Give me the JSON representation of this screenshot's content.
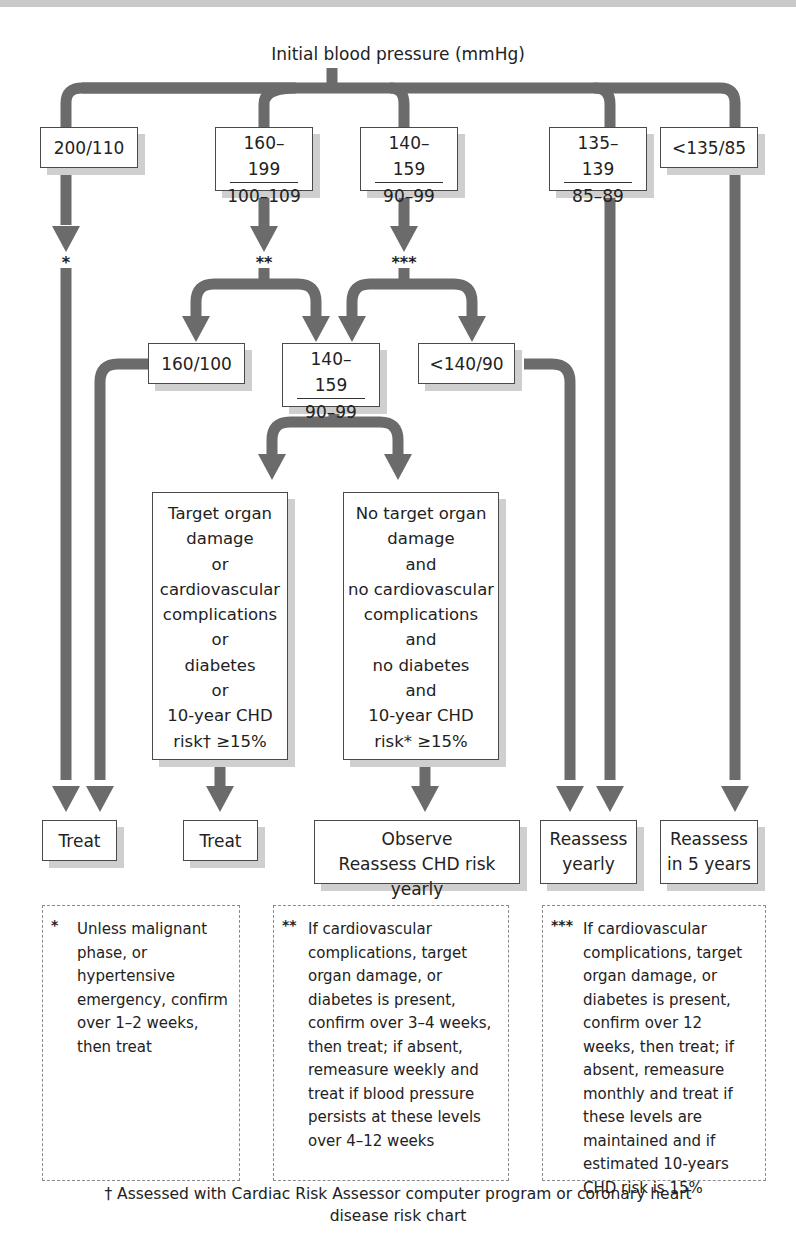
{
  "title": "Initial blood pressure (mmHg)",
  "level1": [
    {
      "id": "bp-200-110",
      "label": "200/110"
    },
    {
      "id": "bp-160-199",
      "top": "160–199",
      "bottom": "100–109"
    },
    {
      "id": "bp-140-159",
      "top": "140–159",
      "bottom": "90–99"
    },
    {
      "id": "bp-135-139",
      "top": "135–139",
      "bottom": "85–89"
    },
    {
      "id": "bp-lt-135-85",
      "label": "<135/85"
    }
  ],
  "markers": {
    "single": "*",
    "double": "**",
    "triple": "***"
  },
  "level2": [
    {
      "id": "bp-160-100",
      "label": "160/100"
    },
    {
      "id": "bp-140-159-followup",
      "top": "140–159",
      "bottom": "90–99"
    },
    {
      "id": "bp-lt-140-90",
      "label": "<140/90"
    }
  ],
  "conditions": {
    "risk_present": [
      "Target organ",
      "damage",
      "or",
      "cardiovascular",
      "complications",
      "or",
      "diabetes",
      "or",
      "10-year CHD",
      "risk† ≥15%"
    ],
    "risk_absent": [
      "No target organ",
      "damage",
      "and",
      "no cardiovascular",
      "complications",
      "and",
      "no diabetes",
      "and",
      "10-year CHD",
      "risk* ≥15%"
    ]
  },
  "outcomes": [
    {
      "id": "treat-1",
      "lines": [
        "Treat"
      ]
    },
    {
      "id": "treat-2",
      "lines": [
        "Treat"
      ]
    },
    {
      "id": "observe",
      "lines": [
        "Observe",
        "Reassess CHD risk yearly"
      ]
    },
    {
      "id": "reassess-yearly",
      "lines": [
        "Reassess",
        "yearly"
      ]
    },
    {
      "id": "reassess-5-years",
      "lines": [
        "Reassess",
        "in 5 years"
      ]
    }
  ],
  "notes": [
    {
      "mark": "*",
      "text": "Unless malignant phase, or hypertensive emergency, confirm over 1–2 weeks, then treat"
    },
    {
      "mark": "**",
      "text": "If cardiovascular complications, target organ damage, or diabetes is present, confirm over 3–4 weeks, then treat; if absent, remeasure weekly and treat if blood pressure persists at these levels over 4–12 weeks"
    },
    {
      "mark": "***",
      "text": "If cardiovascular complications, target organ damage, or diabetes is present, confirm over 12 weeks, then treat; if absent, remeasure monthly and treat if these levels are maintained and if estimated 10-years CHD risk is   15%"
    }
  ],
  "footer": {
    "line1": "† Assessed with Cardiac Risk Assessor computer program or coronary heart",
    "line2": "disease risk chart"
  },
  "colors": {
    "connector": "#6b6b6b",
    "box_border": "#4a4a4a",
    "shadow": "#cfcfcf",
    "note_border": "#8a8a8a"
  }
}
